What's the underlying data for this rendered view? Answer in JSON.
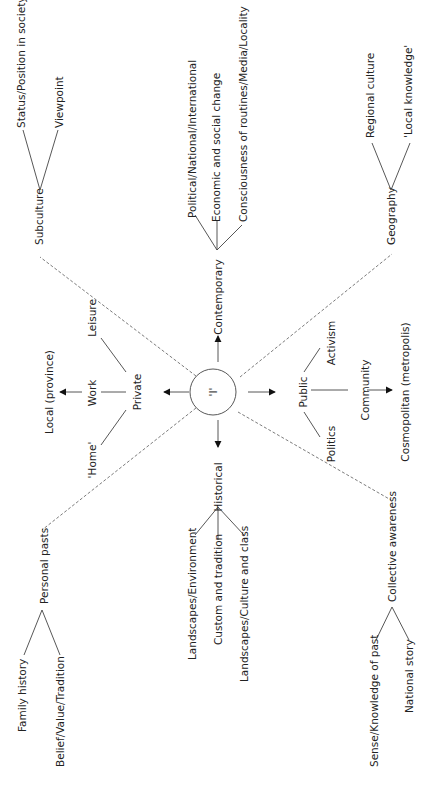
{
  "diagram": {
    "center": {
      "label": "'I'"
    },
    "axes": {
      "up": {
        "label": "Contemporary",
        "children": [
          "Political/National/International",
          "Economic and social change",
          "Consciousness of routines/Media/Locality"
        ]
      },
      "down": {
        "label": "Historical",
        "children": [
          "Landscapes/Environment",
          "Custom and tradition",
          "Landscapes/Culture and class"
        ]
      },
      "left": {
        "label": "Private",
        "children": [
          "'Home'",
          "Work",
          "Leisure"
        ],
        "outcome": "Local (province)"
      },
      "right": {
        "label": "Public",
        "children": [
          "Politics",
          "Community",
          "Activism"
        ],
        "outcome": "Cosmopolitan (metropolis)"
      }
    },
    "diagonals": {
      "upper_left": {
        "label": "Subculture",
        "children": [
          "Status/Position in society",
          "Viewpoint"
        ]
      },
      "lower_left": {
        "label": "Personal pasts",
        "children": [
          "Family history",
          "Belief/Value/Tradition"
        ]
      },
      "upper_right": {
        "label": "Geography",
        "children": [
          "Regional culture",
          "'Local knowledge'"
        ]
      },
      "lower_right": {
        "label": "Collective awareness",
        "children": [
          "Sense/Knowledge of past",
          "National story"
        ]
      }
    }
  }
}
